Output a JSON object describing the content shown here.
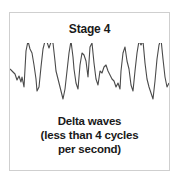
{
  "panel": {
    "title": "Stage 4",
    "caption_lines": [
      "Delta waves",
      "(less than 4 cycles",
      "per second)"
    ],
    "wave_color": "#4a4a4a",
    "border_color": "#cfcfcf"
  }
}
